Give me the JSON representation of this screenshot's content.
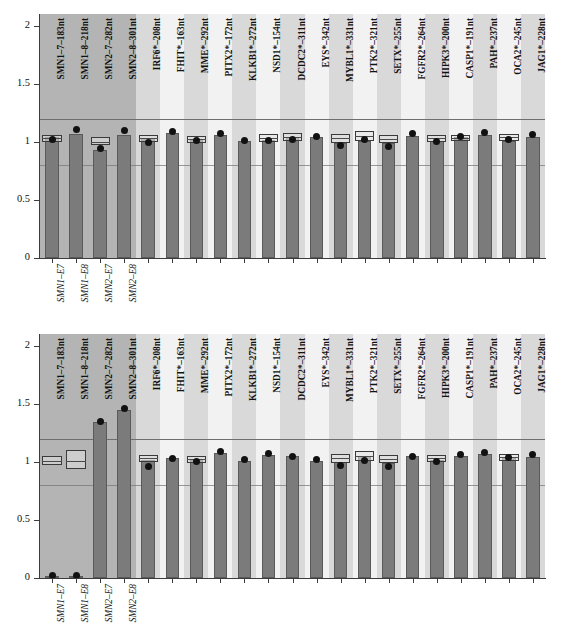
{
  "figure": {
    "background": "#ffffff",
    "bar_color": "#7b7b7b",
    "dot_color": "#111111",
    "band_dark": "#b4b4b4",
    "band_light": "#d9d9d9",
    "band_pale": "#f2f2f2",
    "refline_color": "#6e6e6e"
  },
  "axis": {
    "yticks": [
      "0",
      "0.5",
      "1",
      "1.5",
      "2"
    ],
    "yvalues": [
      0,
      0.5,
      1,
      1.5,
      2
    ],
    "ylim": [
      0,
      2.1
    ],
    "reflines": [
      0.8,
      1.2
    ]
  },
  "categories": [
    "SMN1-7-183nt",
    "SMN1-8-218nt",
    "SMN2-7-282nt",
    "SMN2-8-301nt",
    "IRF6*-208nt",
    "FHIT*-163nt",
    "MME*-292nt",
    "PITX2*-172nt",
    "KLKB1*-272nt",
    "NSD1*-154nt",
    "DCDC2*-311nt",
    "EYS*-342nt",
    "MYBL1*-331nt",
    "PTK2*-321nt",
    "SETX*-255nt",
    "FGFR2*-264nt",
    "HIPK3*-200nt",
    "CASP1*-191nt",
    "PAH*-237nt",
    "OCA2*-245nt",
    "JAG1*-228nt"
  ],
  "group_labels": [
    "SMN1-E7",
    "SMN1-E8",
    "SMN2-E7",
    "SMN2-E8"
  ],
  "chart_data": [
    {
      "type": "bar",
      "panel": "top",
      "title": "",
      "xlabel": "",
      "ylabel": "",
      "ylim": [
        0,
        2.1
      ],
      "categories": [
        "SMN1-7-183nt",
        "SMN1-8-218nt",
        "SMN2-7-282nt",
        "SMN2-8-301nt",
        "IRF6*-208nt",
        "FHIT*-163nt",
        "MME*-292nt",
        "PITX2*-172nt",
        "KLKB1*-272nt",
        "NSD1*-154nt",
        "DCDC2*-311nt",
        "EYS*-342nt",
        "MYBL1*-331nt",
        "PTK2*-321nt",
        "SETX*-255nt",
        "FGFR2*-264nt",
        "HIPK3*-200nt",
        "CASP1*-191nt",
        "PAH*-237nt",
        "OCA2*-245nt",
        "JAG1*-228nt"
      ],
      "values": [
        1.04,
        1.07,
        0.93,
        1.06,
        1.03,
        1.08,
        1.02,
        1.06,
        1.01,
        1.02,
        1.04,
        1.04,
        0.99,
        1.01,
        0.99,
        1.05,
        1.01,
        1.04,
        1.06,
        1.01,
        1.04
      ],
      "dots": [
        1.02,
        1.11,
        0.94,
        1.1,
        0.99,
        1.09,
        1.01,
        1.07,
        1.01,
        1.01,
        1.02,
        1.05,
        0.97,
        1.02,
        0.96,
        1.07,
        1.0,
        1.05,
        1.08,
        1.02,
        1.06
      ],
      "boxes": [
        {
          "index": 0,
          "low": 1.0,
          "high": 1.06,
          "median": 1.03
        },
        {
          "index": 2,
          "low": 0.97,
          "high": 1.04,
          "median": 1.0
        },
        {
          "index": 4,
          "low": 1.0,
          "high": 1.06,
          "median": 1.03
        },
        {
          "index": 6,
          "low": 0.99,
          "high": 1.05,
          "median": 1.02
        },
        {
          "index": 9,
          "low": 1.0,
          "high": 1.07,
          "median": 1.03
        },
        {
          "index": 10,
          "low": 1.01,
          "high": 1.08,
          "median": 1.04
        },
        {
          "index": 12,
          "low": 0.99,
          "high": 1.07,
          "median": 1.03
        },
        {
          "index": 13,
          "low": 1.01,
          "high": 1.09,
          "median": 1.05
        },
        {
          "index": 14,
          "low": 0.99,
          "high": 1.06,
          "median": 1.02
        },
        {
          "index": 16,
          "low": 1.0,
          "high": 1.06,
          "median": 1.03
        },
        {
          "index": 17,
          "low": 1.01,
          "high": 1.06,
          "median": 1.03
        },
        {
          "index": 19,
          "low": 1.01,
          "high": 1.07,
          "median": 1.04
        }
      ],
      "reflines": [
        0.8,
        1.2
      ],
      "grid": false,
      "legend": "none"
    },
    {
      "type": "bar",
      "panel": "bottom",
      "title": "",
      "xlabel": "",
      "ylabel": "",
      "ylim": [
        0,
        2.1
      ],
      "categories": [
        "SMN1-7-183nt",
        "SMN1-8-218nt",
        "SMN2-7-282nt",
        "SMN2-8-301nt",
        "IRF6*-208nt",
        "FHIT*-163nt",
        "MME*-292nt",
        "PITX2*-172nt",
        "KLKB1*-272nt",
        "NSD1*-154nt",
        "DCDC2*-311nt",
        "EYS*-342nt",
        "MYBL1*-331nt",
        "PTK2*-321nt",
        "SETX*-255nt",
        "FGFR2*-264nt",
        "HIPK3*-200nt",
        "CASP1*-191nt",
        "PAH*-237nt",
        "OCA2*-245nt",
        "JAG1*-228nt"
      ],
      "values": [
        0.02,
        0.02,
        1.34,
        1.45,
        1.02,
        1.03,
        1.02,
        1.08,
        1.01,
        1.06,
        1.05,
        1.01,
        1.0,
        1.05,
        0.99,
        1.05,
        1.02,
        1.05,
        1.07,
        1.04,
        1.04
      ],
      "dots": [
        0.02,
        0.02,
        1.35,
        1.46,
        0.96,
        1.03,
        1.0,
        1.09,
        1.02,
        1.07,
        1.05,
        1.02,
        0.97,
        1.01,
        0.96,
        1.05,
        1.0,
        1.06,
        1.08,
        1.04,
        1.06
      ],
      "boxes": [
        {
          "index": 0,
          "low": 0.97,
          "high": 1.05,
          "median": 1.01
        },
        {
          "index": 1,
          "low": 0.94,
          "high": 1.1,
          "median": 1.01
        },
        {
          "index": 4,
          "low": 1.0,
          "high": 1.06,
          "median": 1.03
        },
        {
          "index": 6,
          "low": 0.99,
          "high": 1.05,
          "median": 1.02
        },
        {
          "index": 12,
          "low": 0.99,
          "high": 1.07,
          "median": 1.03
        },
        {
          "index": 13,
          "low": 1.01,
          "high": 1.09,
          "median": 1.05
        },
        {
          "index": 14,
          "low": 0.99,
          "high": 1.06,
          "median": 1.02
        },
        {
          "index": 16,
          "low": 1.0,
          "high": 1.06,
          "median": 1.03
        },
        {
          "index": 19,
          "low": 1.01,
          "high": 1.07,
          "median": 1.04
        }
      ],
      "reflines": [
        0.8,
        1.2
      ],
      "grid": false,
      "legend": "none"
    }
  ]
}
